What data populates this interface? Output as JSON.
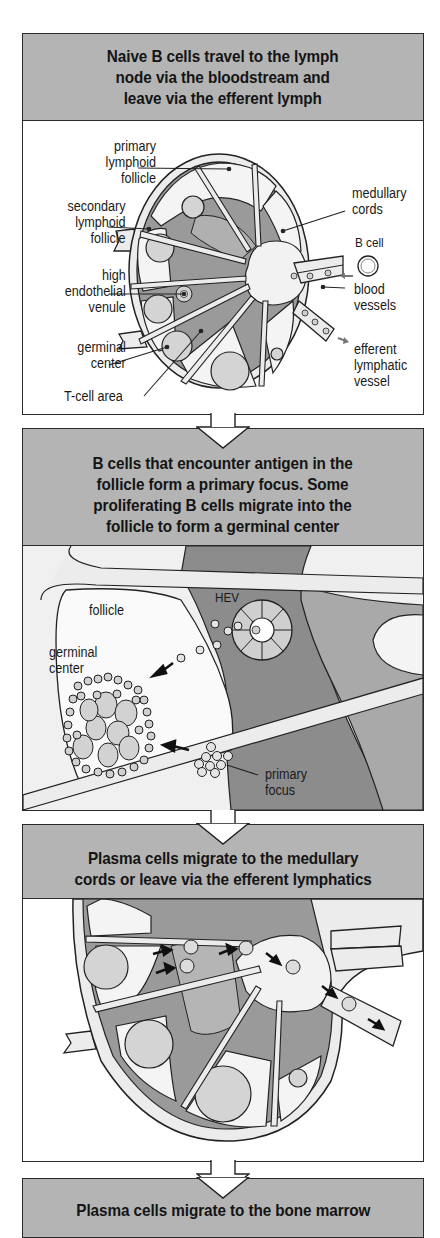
{
  "panels": [
    {
      "title": "Naive B cells travel to the lymph\nnode via the bloodstream and\nleave via the efferent lymph",
      "labels": {
        "primary_follicle": "primary\nlymphoid\nfollicle",
        "secondary_follicle": "secondary\nlymphoid\nfollicle",
        "hev": "high\nendothelial\nvenule",
        "germinal_center": "germinal\ncenter",
        "t_cell_area": "T-cell area",
        "medullary_cords": "medullary\ncords",
        "b_cell": "B cell",
        "blood_vessels": "blood\nvessels",
        "efferent_lymphatic": "efferent\nlymphatic\nvessel"
      }
    },
    {
      "title": "B cells that encounter antigen in the\nfollicle form a primary focus. Some\nproliferating B cells migrate into the\nfollicle to form a germinal center",
      "labels": {
        "follicle": "follicle",
        "hev": "HEV",
        "germinal_center": "germinal\ncenter",
        "primary_focus": "primary\nfocus"
      }
    },
    {
      "title": "Plasma cells migrate to the medullary\ncords or leave via the efferent lymphatics",
      "labels": {}
    },
    {
      "title": "Plasma cells migrate to the bone marrow",
      "labels": {}
    }
  ],
  "colors": {
    "header_bg": "#b4b4b4",
    "dark_gray": "#8a8a8a",
    "mid_gray": "#a9a9a9",
    "light_gray": "#d4d4d4",
    "pale": "#ececec",
    "outline": "#2a2a2a"
  }
}
